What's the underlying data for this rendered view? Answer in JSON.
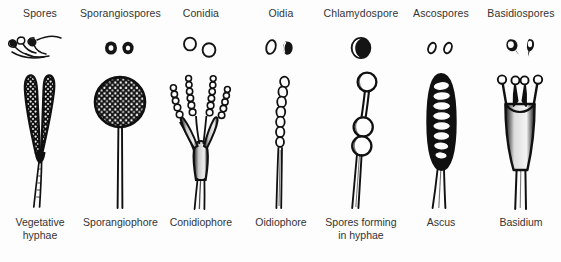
{
  "figure": {
    "background": "#fdfdfd",
    "ink": "#1a1a1a",
    "columns": [
      {
        "spore_label": "Spores",
        "structure_label": "Vegetative\nhyphae",
        "spore_icon": "hyphal-fragments-with-spores",
        "structure_icon": "branched-vegetative-hypha"
      },
      {
        "spore_label": "Sporangiospores",
        "structure_label": "Sporangiophore",
        "spore_icon": "two-filled-round-spores",
        "structure_icon": "sporangium-on-stalk"
      },
      {
        "spore_label": "Conidia",
        "structure_label": "Conidiophore",
        "spore_icon": "two-open-round-spores",
        "structure_icon": "branched-conidiophore-with-spore-chains"
      },
      {
        "spore_label": "Oidia",
        "structure_label": "Oidiophore",
        "spore_icon": "two-oval-barrel-spores",
        "structure_icon": "filament-with-oidia-chain"
      },
      {
        "spore_label": "Chlamydospore",
        "structure_label": "Spores forming\nin hyphae",
        "spore_icon": "thick-walled-round-spore",
        "structure_icon": "hypha-with-three-chlamydospores"
      },
      {
        "spore_label": "Ascospores",
        "structure_label": "Ascus",
        "spore_icon": "two-small-oval-spores",
        "structure_icon": "ascus-sac-with-ascospores"
      },
      {
        "spore_label": "Basidiospores",
        "structure_label": "Basidium",
        "spore_icon": "two-apiculate-teardrop-spores",
        "structure_icon": "club-basidium-with-four-sterigmata"
      }
    ]
  }
}
